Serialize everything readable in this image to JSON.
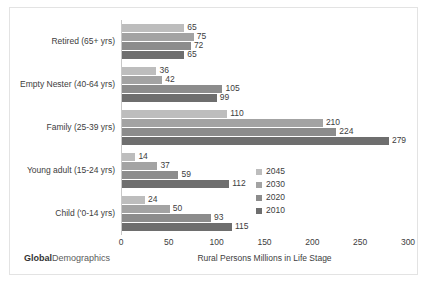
{
  "brand": {
    "bold_part": "Global",
    "regular_part": "Demographics"
  },
  "chart_data": {
    "type": "bar",
    "orientation": "horizontal",
    "title": "",
    "xlabel": "Rural Persons Millions in Life Stage",
    "ylabel": "",
    "xlim": [
      0,
      300
    ],
    "xticks": [
      0,
      50,
      100,
      150,
      200,
      250,
      300
    ],
    "xtick_labels": [
      "0",
      "50",
      "100",
      "150",
      "200",
      "250",
      "300"
    ],
    "grid": false,
    "legend_position": "inside-right",
    "categories": [
      "Retired (65+ yrs)",
      "Empty Nester (40-64 yrs)",
      "Family (25-39 yrs)",
      "Young adult (15-24 yrs)",
      "Child ('0-14 yrs)"
    ],
    "series": [
      {
        "name": "2045",
        "color": "#bdbdbd",
        "values": [
          65,
          36,
          110,
          14,
          24
        ]
      },
      {
        "name": "2030",
        "color": "#a3a3a3",
        "values": [
          75,
          42,
          210,
          37,
          50
        ]
      },
      {
        "name": "2020",
        "color": "#8c8c8c",
        "values": [
          72,
          105,
          224,
          59,
          93
        ]
      },
      {
        "name": "2010",
        "color": "#6e6e6e",
        "values": [
          65,
          99,
          279,
          112,
          115
        ]
      }
    ]
  }
}
